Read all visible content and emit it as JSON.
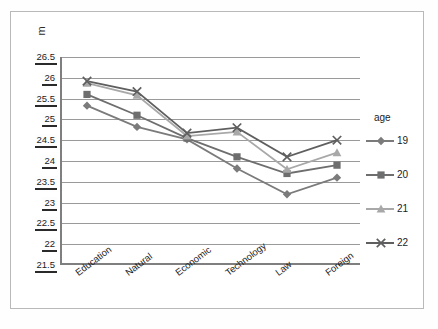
{
  "chart_data": {
    "type": "line",
    "title": "",
    "subtitle": "",
    "xlabel": "",
    "ylabel": "m",
    "categories": [
      "Education",
      "Natural",
      "Economic",
      "Technology",
      "Law",
      "Foreign"
    ],
    "ylim": [
      21.5,
      26.5
    ],
    "ytick_step": 0.5,
    "yticks": [
      "26.5",
      "26",
      "25.5",
      "25",
      "24.5",
      "24",
      "23.5",
      "23",
      "22.5",
      "22",
      "21.5"
    ],
    "grid": true,
    "legend_position": "right",
    "legend_title": "age",
    "series": [
      {
        "name": "19",
        "marker": "diamond",
        "color": "#7b7b7b",
        "values": [
          25.33,
          24.82,
          24.52,
          23.82,
          23.2,
          23.6
        ]
      },
      {
        "name": "20",
        "marker": "square",
        "color": "#6e6e6e",
        "values": [
          25.6,
          25.1,
          24.55,
          24.1,
          23.7,
          23.9
        ]
      },
      {
        "name": "21",
        "marker": "triangle",
        "color": "#a8a8a8",
        "values": [
          25.87,
          25.58,
          24.6,
          24.7,
          23.8,
          24.2
        ]
      },
      {
        "name": "22",
        "marker": "cross",
        "color": "#5f5f5f",
        "values": [
          25.92,
          25.67,
          24.67,
          24.8,
          24.1,
          24.5
        ]
      }
    ]
  },
  "axes": {
    "y_title": "m"
  },
  "colors": {
    "plot_border": "#7f7f7f",
    "gridline": "#9a9a9a",
    "frame": "#b9b9b9",
    "text": "#1b1b1b",
    "background": "#ffffff"
  }
}
